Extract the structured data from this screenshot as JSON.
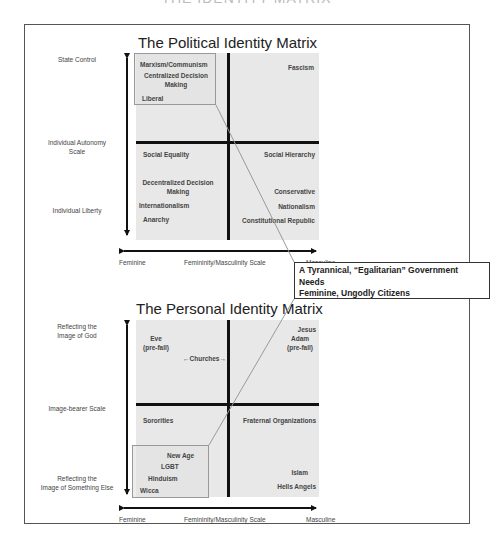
{
  "page_title": "THE IDENTITY MATRIX",
  "political_matrix": {
    "title": "The Political Identity Matrix",
    "y_axis": {
      "top": "State Control",
      "middle_line1": "Individual Autonomy",
      "middle_line2": "Scale",
      "bottom": "Individual Liberty"
    },
    "x_axis": {
      "left": "Feminine",
      "middle": "Femininity/Masculinity Scale",
      "right": "Masculine"
    },
    "top_left": [
      "Marxism/Communism",
      "Centralized Decision",
      "Making",
      "Liberal"
    ],
    "top_right": [
      "Fascism"
    ],
    "bottom_left": [
      "Social Equality",
      "Decentralized Decision",
      "Making",
      "Internationalism",
      "Anarchy"
    ],
    "bottom_right": [
      "Social Hierarchy",
      "Conservative",
      "Nationalism",
      "Constitutional Republic"
    ]
  },
  "callout": {
    "line1": "A Tyrannical, “Egalitarian” Government",
    "line2": "Needs",
    "line3": "Feminine, Ungodly Citizens"
  },
  "personal_matrix": {
    "title": "The Personal Identity Matrix",
    "y_axis": {
      "top_line1": "Reflecting the",
      "top_line2": "Image of God",
      "middle": "Image-bearer Scale",
      "bottom_line1": "Reflecting the",
      "bottom_line2": "Image of Something Else"
    },
    "x_axis": {
      "left": "Feminine",
      "middle": "Femininity/Masculinity Scale",
      "right": "Masculine"
    },
    "top_left": [
      "Eve",
      "(pre-fall)"
    ],
    "churches": "Churches",
    "top_right": [
      "Jesus",
      "Adam",
      "(pre-fall)"
    ],
    "bottom_left": [
      "Sororities",
      "New Age",
      "LGBT",
      "Hinduism",
      "Wicca"
    ],
    "bottom_right": [
      "Fraternal Organizations",
      "Islam",
      "Hells Angels"
    ]
  },
  "colors": {
    "matrix_fill": "#e8e8e8",
    "axis_line": "#111111",
    "frame": "#555555",
    "connector": "#999999"
  }
}
